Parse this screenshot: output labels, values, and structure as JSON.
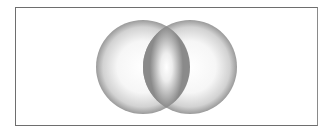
{
  "diagram": {
    "type": "venn",
    "sets": [
      {
        "name": "left-circle",
        "cx": 143,
        "cy": 67,
        "r": 47
      },
      {
        "name": "right-circle",
        "cx": 190,
        "cy": 67,
        "r": 47
      }
    ],
    "colors": {
      "border": "#6e6e6e",
      "circle_edge": "#8c8c8c",
      "circle_center": "#ffffff",
      "intersection_edge": "#7a7a7a"
    }
  }
}
